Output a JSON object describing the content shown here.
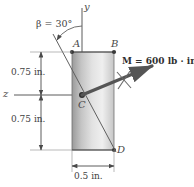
{
  "figure": {
    "background_color": "#ffffff",
    "line_color": "#4a4a4a",
    "vector_color": "#555555"
  },
  "axes": {
    "y_label": "y",
    "z_label": "z"
  },
  "points": {
    "A": "A",
    "B": "B",
    "C": "C",
    "D": "D"
  },
  "angle": {
    "symbol": "β",
    "text": "β = 30°",
    "value": 30,
    "unit": "degrees"
  },
  "moment": {
    "symbol": "M",
    "text": "M = 600 lb · in.",
    "value": 600,
    "unit": "lb · in."
  },
  "dimensions": {
    "upper_height": "0.75 in.",
    "lower_height": "0.75 in.",
    "width": "0.5 in."
  },
  "section": {
    "width_in": 0.5,
    "height_in": 1.5,
    "fill_gradient": [
      "#8f8f8f",
      "#d6d6d6",
      "#f2f2f2",
      "#c9c9c9"
    ]
  }
}
